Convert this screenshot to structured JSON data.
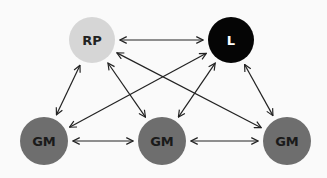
{
  "diagram": {
    "nodes": [
      {
        "id": "rp",
        "label": "RP",
        "fill": "#d6d6d6",
        "text_color": "#222222"
      },
      {
        "id": "l",
        "label": "L",
        "fill": "#050505",
        "text_color": "#ffffff"
      },
      {
        "id": "gm1",
        "label": "GM",
        "fill": "#6e6e6e",
        "text_color": "#1a1a1a"
      },
      {
        "id": "gm2",
        "label": "GM",
        "fill": "#6e6e6e",
        "text_color": "#1a1a1a"
      },
      {
        "id": "gm3",
        "label": "GM",
        "fill": "#6e6e6e",
        "text_color": "#1a1a1a"
      }
    ],
    "edges": [
      {
        "from": "rp",
        "to": "l",
        "bidirectional": true
      },
      {
        "from": "rp",
        "to": "gm1",
        "bidirectional": true
      },
      {
        "from": "rp",
        "to": "gm2",
        "bidirectional": true
      },
      {
        "from": "rp",
        "to": "gm3",
        "bidirectional": true
      },
      {
        "from": "l",
        "to": "gm1",
        "bidirectional": true
      },
      {
        "from": "l",
        "to": "gm2",
        "bidirectional": true
      },
      {
        "from": "l",
        "to": "gm3",
        "bidirectional": true
      },
      {
        "from": "gm1",
        "to": "gm2",
        "bidirectional": true
      },
      {
        "from": "gm2",
        "to": "gm3",
        "bidirectional": true
      }
    ],
    "edge_color": "#222222"
  }
}
